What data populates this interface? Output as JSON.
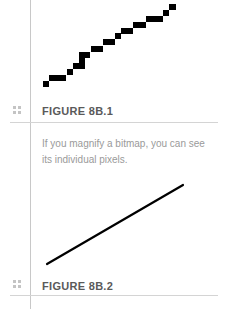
{
  "figures": [
    {
      "label": "FIGURE 8B.1",
      "caption": "If you magnify a bitmap, you can see its individual pixels.",
      "illustration": "magnified-bitmap-stairstep-line"
    },
    {
      "label": "FIGURE 8B.2",
      "illustration": "smooth-vector-line"
    }
  ],
  "colors": {
    "rule": "#c8c8c8",
    "label_text": "#5a5a5a",
    "caption_text": "#9a9a9a",
    "pixel": "#000000"
  },
  "icons": {
    "figure_marker": "grip-icon"
  }
}
